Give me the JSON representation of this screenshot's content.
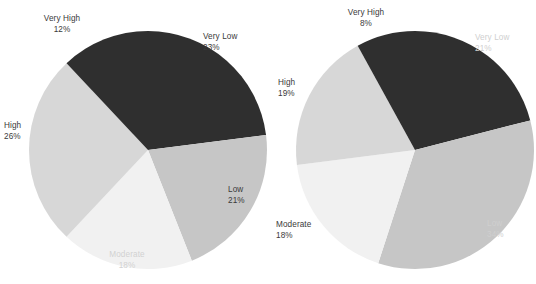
{
  "colors": {
    "background": "#ffffff",
    "very_low": "#2f2f2f",
    "low": "#c6c6c6",
    "moderate": "#f1f1f1",
    "high": "#d7d7d7",
    "very_high": "#2f2f2f",
    "label_dark": "#3a3a3a",
    "label_light": "#d2d2d2"
  },
  "chart_data": [
    {
      "type": "pie",
      "title": "",
      "name": "left-pie-chart",
      "labels": [
        "Very Low",
        "Low",
        "Moderate",
        "High",
        "Very High"
      ],
      "values": [
        23,
        21,
        18,
        26,
        12
      ],
      "value_labels": [
        "23%",
        "21%",
        "18%",
        "26%",
        "12%"
      ],
      "colors": [
        "#2f2f2f",
        "#c6c6c6",
        "#f1f1f1",
        "#d7d7d7",
        "#2f2f2f"
      ],
      "label_colors": [
        "#3a3a3a",
        "#3a3a3a",
        "#d2d2d2",
        "#3a3a3a",
        "#3a3a3a"
      ],
      "start_angle": 0,
      "direction": "clockwise",
      "legend": "none",
      "grid": false
    },
    {
      "type": "pie",
      "title": "",
      "name": "right-pie-chart",
      "labels": [
        "Very Low",
        "Low",
        "Moderate",
        "High",
        "Very High"
      ],
      "values": [
        21,
        34,
        18,
        19,
        8
      ],
      "value_labels": [
        "21%",
        "34%",
        "18%",
        "19%",
        "8%"
      ],
      "colors": [
        "#2f2f2f",
        "#c6c6c6",
        "#f1f1f1",
        "#d7d7d7",
        "#2f2f2f"
      ],
      "label_colors": [
        "#cfcfcf",
        "#cfcfcf",
        "#3a3a3a",
        "#3a3a3a",
        "#3a3a3a"
      ],
      "start_angle": 0,
      "direction": "clockwise",
      "legend": "none",
      "grid": false
    }
  ],
  "left_chart": {
    "very_low": {
      "label": "Very Low",
      "value": "23%"
    },
    "low": {
      "label": "Low",
      "value": "21%"
    },
    "moderate": {
      "label": "Moderate",
      "value": "18%"
    },
    "high": {
      "label": "High",
      "value": "26%"
    },
    "very_high": {
      "label": "Very High",
      "value": "12%"
    }
  },
  "right_chart": {
    "very_low": {
      "label": "Very Low",
      "value": "21%"
    },
    "low": {
      "label": "Low",
      "value": "34%"
    },
    "moderate": {
      "label": "Moderate",
      "value": "18%"
    },
    "high": {
      "label": "High",
      "value": "19%"
    },
    "very_high": {
      "label": "Very High",
      "value": "8%"
    }
  }
}
